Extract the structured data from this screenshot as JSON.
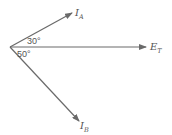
{
  "diagram": {
    "type": "phasor",
    "vectors": [
      {
        "id": "IA",
        "label": "I",
        "subscript": "A",
        "angle_deg": 30
      },
      {
        "id": "ET",
        "label": "E",
        "subscript": "T",
        "angle_deg": 0
      },
      {
        "id": "IB",
        "label": "I",
        "subscript": "B",
        "angle_deg": -50
      }
    ],
    "angles": [
      {
        "label": "30°",
        "between": [
          "ET",
          "IA"
        ]
      },
      {
        "label": "50°",
        "between": [
          "ET",
          "IB"
        ]
      }
    ],
    "colors": {
      "stroke": "#6a6a6a",
      "text": "#555555"
    }
  }
}
